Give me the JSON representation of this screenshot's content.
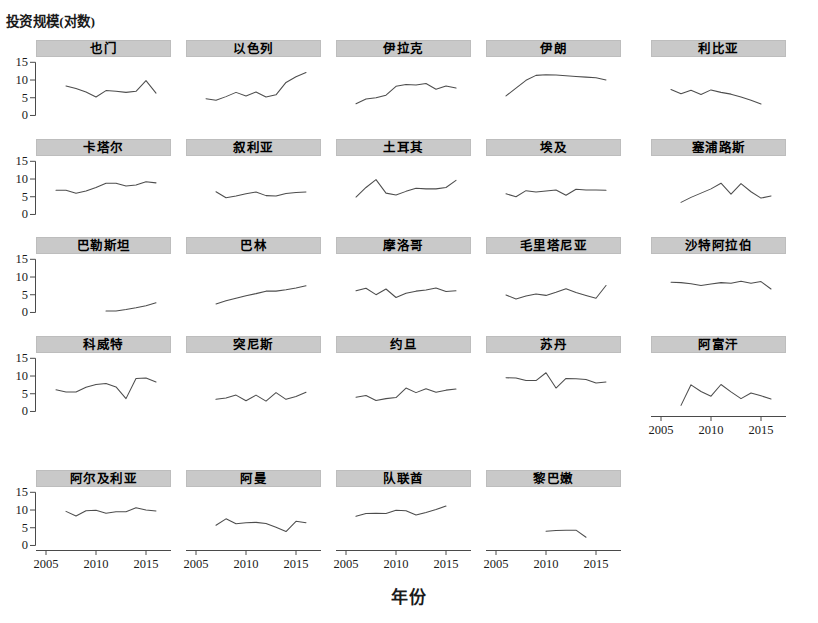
{
  "axis": {
    "ylabel": "投资规模(对数)",
    "xlabel": "年份",
    "y_ticks": [
      "0",
      "5",
      "10",
      "15"
    ],
    "x_ticks": [
      "2005",
      "2010",
      "2015"
    ]
  },
  "style": {
    "strip_bg": "#c9c9c9",
    "line_color": "#4d4d4d",
    "axis_color": "#4a4a4a",
    "background": "#ffffff"
  },
  "chart_data": {
    "type": "line",
    "title": "",
    "xlabel": "年份",
    "ylabel": "投资规模(对数)",
    "xlim": [
      2004.0,
      2017.5
    ],
    "ylim": [
      -1.0,
      16.5
    ],
    "grid": false,
    "legend": "none",
    "layout": {
      "rows": 5,
      "cols": 5,
      "panels": 24
    },
    "x_tick_values": [
      2005,
      2010,
      2015
    ],
    "y_tick_values": [
      0,
      5,
      10,
      15
    ],
    "panels": [
      {
        "name": "也门",
        "row": 1,
        "col": 1,
        "x": [
          2007,
          2008,
          2009,
          2010,
          2011,
          2012,
          2013,
          2014,
          2015,
          2016
        ],
        "y": [
          8.6,
          7.9,
          6.9,
          5.5,
          7.3,
          7.1,
          6.8,
          7.1,
          10.1,
          6.6
        ]
      },
      {
        "name": "以色列",
        "row": 1,
        "col": 2,
        "x": [
          2006,
          2007,
          2008,
          2009,
          2010,
          2011,
          2012,
          2013,
          2014,
          2015,
          2016
        ],
        "y": [
          5.0,
          4.6,
          5.6,
          6.8,
          5.8,
          6.9,
          5.5,
          6.1,
          9.6,
          11.2,
          12.4
        ]
      },
      {
        "name": "伊拉克",
        "row": 1,
        "col": 3,
        "x": [
          2006,
          2007,
          2008,
          2009,
          2010,
          2011,
          2012,
          2013,
          2014,
          2015,
          2016
        ],
        "y": [
          3.6,
          4.9,
          5.3,
          6.0,
          8.5,
          9.0,
          8.9,
          9.3,
          7.7,
          8.6,
          8.0
        ]
      },
      {
        "name": "伊朗",
        "row": 1,
        "col": 4,
        "x": [
          2006,
          2007,
          2008,
          2009,
          2010,
          2011,
          2012,
          2013,
          2014,
          2015,
          2016
        ],
        "y": [
          5.8,
          8.0,
          10.2,
          11.6,
          11.8,
          11.7,
          11.5,
          11.3,
          11.1,
          10.9,
          10.3
        ]
      },
      {
        "name": "利比亚",
        "row": 1,
        "col": 5,
        "x": [
          2006,
          2007,
          2008,
          2009,
          2010,
          2011,
          2012,
          2013,
          2014,
          2015
        ],
        "y": [
          7.6,
          6.4,
          7.4,
          6.2,
          7.5,
          6.8,
          6.3,
          5.5,
          4.6,
          3.5
        ]
      },
      {
        "name": "卡塔尔",
        "row": 2,
        "col": 1,
        "x": [
          2006,
          2007,
          2008,
          2009,
          2010,
          2011,
          2012,
          2013,
          2014,
          2015,
          2016
        ],
        "y": [
          7.1,
          7.1,
          6.3,
          6.9,
          7.9,
          9.1,
          9.1,
          8.3,
          8.6,
          9.5,
          9.2
        ]
      },
      {
        "name": "叙利亚",
        "row": 2,
        "col": 2,
        "x": [
          2007,
          2008,
          2009,
          2010,
          2011,
          2012,
          2013,
          2014,
          2015,
          2016
        ],
        "y": [
          6.7,
          5.0,
          5.5,
          6.1,
          6.6,
          5.6,
          5.5,
          6.2,
          6.5,
          6.6
        ]
      },
      {
        "name": "土耳其",
        "row": 2,
        "col": 3,
        "x": [
          2006,
          2007,
          2008,
          2009,
          2010,
          2011,
          2012,
          2013,
          2014,
          2015,
          2016
        ],
        "y": [
          5.2,
          7.9,
          10.1,
          6.3,
          5.8,
          6.8,
          7.7,
          7.5,
          7.5,
          7.9,
          9.9
        ]
      },
      {
        "name": "埃及",
        "row": 2,
        "col": 4,
        "x": [
          2006,
          2007,
          2008,
          2009,
          2010,
          2011,
          2012,
          2013,
          2014,
          2015,
          2016
        ],
        "y": [
          6.1,
          5.3,
          7.0,
          6.6,
          6.9,
          7.2,
          5.7,
          7.4,
          7.2,
          7.2,
          7.1
        ]
      },
      {
        "name": "塞浦路斯",
        "row": 2,
        "col": 5,
        "x": [
          2007,
          2008,
          2009,
          2010,
          2011,
          2012,
          2013,
          2014,
          2015,
          2016
        ],
        "y": [
          3.7,
          5.1,
          6.3,
          7.5,
          9.1,
          6.0,
          9.0,
          6.7,
          4.9,
          5.5
        ]
      },
      {
        "name": "巴勒斯坦",
        "row": 3,
        "col": 1,
        "x": [
          2011,
          2012,
          2013,
          2014,
          2015,
          2016
        ],
        "y": [
          0.7,
          0.7,
          1.1,
          1.6,
          2.2,
          3.0
        ]
      },
      {
        "name": "巴林",
        "row": 3,
        "col": 2,
        "x": [
          2007,
          2008,
          2009,
          2010,
          2011,
          2012,
          2013,
          2014,
          2015,
          2016
        ],
        "y": [
          2.7,
          3.6,
          4.3,
          5.0,
          5.6,
          6.3,
          6.3,
          6.7,
          7.2,
          7.8
        ]
      },
      {
        "name": "摩洛哥",
        "row": 3,
        "col": 3,
        "x": [
          2006,
          2007,
          2008,
          2009,
          2010,
          2011,
          2012,
          2013,
          2014,
          2015,
          2016
        ],
        "y": [
          6.4,
          7.1,
          5.3,
          6.9,
          4.5,
          5.7,
          6.3,
          6.6,
          7.2,
          6.2,
          6.4
        ]
      },
      {
        "name": "毛里塔尼亚",
        "row": 3,
        "col": 4,
        "x": [
          2006,
          2007,
          2008,
          2009,
          2010,
          2011,
          2012,
          2013,
          2014,
          2015,
          2016
        ],
        "y": [
          5.2,
          4.1,
          4.9,
          5.5,
          5.1,
          6.0,
          7.0,
          5.9,
          5.1,
          4.3,
          7.9
        ]
      },
      {
        "name": "沙特阿拉伯",
        "row": 3,
        "col": 5,
        "x": [
          2006,
          2007,
          2008,
          2009,
          2010,
          2011,
          2012,
          2013,
          2014,
          2015,
          2016
        ],
        "y": [
          8.8,
          8.7,
          8.4,
          7.9,
          8.3,
          8.7,
          8.5,
          9.1,
          8.5,
          9.0,
          6.9
        ]
      },
      {
        "name": "科威特",
        "row": 4,
        "col": 1,
        "x": [
          2006,
          2007,
          2008,
          2009,
          2010,
          2011,
          2012,
          2013,
          2014,
          2015,
          2016
        ],
        "y": [
          6.4,
          5.8,
          5.8,
          7.1,
          7.9,
          8.2,
          7.2,
          3.9,
          9.6,
          9.7,
          8.6
        ]
      },
      {
        "name": "突尼斯",
        "row": 4,
        "col": 2,
        "x": [
          2007,
          2008,
          2009,
          2010,
          2011,
          2012,
          2013,
          2014,
          2015,
          2016
        ],
        "y": [
          3.7,
          4.1,
          4.9,
          3.3,
          4.9,
          3.2,
          5.6,
          3.7,
          4.5,
          5.7
        ]
      },
      {
        "name": "约旦",
        "row": 4,
        "col": 3,
        "x": [
          2006,
          2007,
          2008,
          2009,
          2010,
          2011,
          2012,
          2013,
          2014,
          2015,
          2016
        ],
        "y": [
          4.3,
          4.8,
          3.4,
          3.9,
          4.2,
          6.9,
          5.6,
          6.7,
          5.7,
          6.3,
          6.6
        ]
      },
      {
        "name": "苏丹",
        "row": 4,
        "col": 4,
        "x": [
          2006,
          2007,
          2008,
          2009,
          2010,
          2011,
          2012,
          2013,
          2014,
          2015,
          2016
        ],
        "y": [
          9.8,
          9.7,
          9.0,
          9.0,
          11.2,
          6.9,
          9.6,
          9.5,
          9.3,
          8.3,
          8.6
        ]
      },
      {
        "name": "阿富汗",
        "row": 4,
        "col": 5,
        "x": [
          2007,
          2008,
          2009,
          2010,
          2011,
          2012,
          2013,
          2014,
          2015,
          2016
        ],
        "y": [
          2.0,
          7.8,
          5.9,
          4.6,
          7.9,
          5.8,
          3.9,
          5.5,
          4.7,
          3.8
        ]
      },
      {
        "name": "阿尔及利亚",
        "row": 5,
        "col": 1,
        "x": [
          2007,
          2008,
          2009,
          2010,
          2011,
          2012,
          2013,
          2014,
          2015,
          2016
        ],
        "y": [
          9.9,
          8.6,
          10.1,
          10.2,
          9.4,
          9.8,
          9.8,
          10.9,
          10.3,
          10.0
        ]
      },
      {
        "name": "阿曼",
        "row": 5,
        "col": 2,
        "x": [
          2007,
          2008,
          2009,
          2010,
          2011,
          2012,
          2013,
          2014,
          2015,
          2016
        ],
        "y": [
          6.0,
          7.8,
          6.4,
          6.7,
          6.8,
          6.5,
          5.4,
          4.2,
          7.1,
          6.7
        ]
      },
      {
        "name": "队联酋",
        "row": 5,
        "col": 3,
        "x": [
          2006,
          2007,
          2008,
          2009,
          2010,
          2011,
          2012,
          2013,
          2014,
          2015
        ],
        "y": [
          8.5,
          9.3,
          9.4,
          9.3,
          10.2,
          10.1,
          8.9,
          9.6,
          10.4,
          11.4
        ]
      },
      {
        "name": "黎巴嫩",
        "row": 5,
        "col": 4,
        "x": [
          2010,
          2011,
          2012,
          2013,
          2014
        ],
        "y": [
          4.3,
          4.5,
          4.6,
          4.6,
          2.6
        ]
      }
    ]
  }
}
